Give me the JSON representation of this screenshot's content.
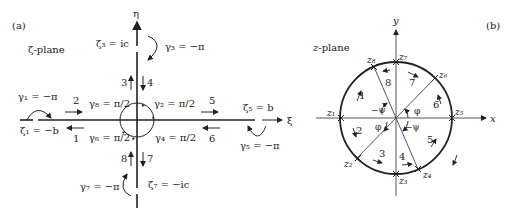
{
  "panel_a": {
    "label": "(a)",
    "plane_label": "ζ-plane",
    "axis_vertical": "η",
    "axis_horizontal": "ξ",
    "points": [
      {
        "id": "zeta1",
        "text": "ζ₁ = −b"
      },
      {
        "id": "zeta3",
        "text": "ζ₃ = ic"
      },
      {
        "id": "zeta5",
        "text": "ζ₅ = b"
      },
      {
        "id": "zeta7",
        "text": "ζ₇ = −ic"
      }
    ],
    "angles": [
      {
        "id": "gamma1",
        "text": "γ₁ = −π"
      },
      {
        "id": "gamma2",
        "text": "γ₂ = π/2"
      },
      {
        "id": "gamma3",
        "text": "γ₃ = −π"
      },
      {
        "id": "gamma4",
        "text": "γ₄ = π/2"
      },
      {
        "id": "gamma5",
        "text": "γ₅ = −π"
      },
      {
        "id": "gamma6",
        "text": "γ₆ = π/2"
      },
      {
        "id": "gamma7",
        "text": "γ₇ = −π"
      },
      {
        "id": "gamma8",
        "text": "γ₈ = π/2"
      }
    ],
    "segments": [
      "1",
      "2",
      "3",
      "4",
      "5",
      "6",
      "7",
      "8"
    ]
  },
  "panel_b": {
    "label": "(b)",
    "plane_label": "z-plane",
    "axis_vertical": "y",
    "axis_horizontal": "x",
    "points": [
      "z₁",
      "z₂",
      "z₃",
      "z₄",
      "z₅",
      "z₆",
      "z₇",
      "z₈"
    ],
    "segments": [
      "1",
      "2",
      "3",
      "4",
      "5",
      "6",
      "7",
      "8"
    ],
    "angles": {
      "phi": "φ",
      "neg_psi": "−ψ"
    }
  }
}
